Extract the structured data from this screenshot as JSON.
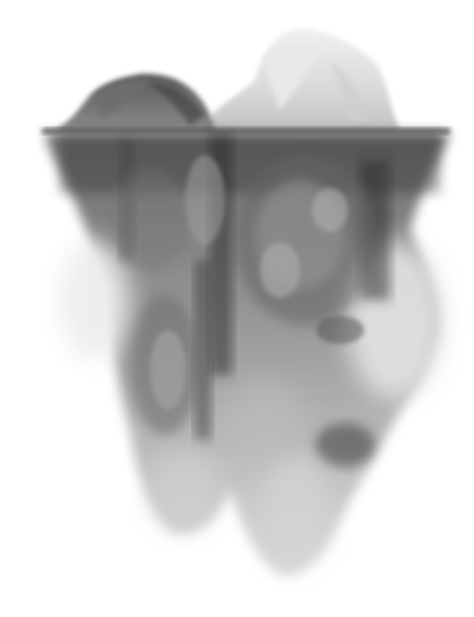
{
  "image": {
    "subject": "ink-smoke iceberg illustration",
    "width": 474,
    "height": 617,
    "palette": {
      "background": "#ffffff",
      "darkest": "#2a2a2a",
      "dark": "#4a4a4a",
      "mid": "#7a7a7a",
      "light": "#b8b8b8",
      "faint": "#e2e2e2"
    },
    "waterline_y": 130
  }
}
